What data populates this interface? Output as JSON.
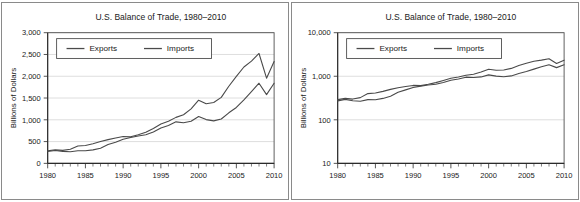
{
  "figure": {
    "panels": [
      "linear",
      "log"
    ]
  },
  "chart_data": [
    {
      "type": "line",
      "scale": "linear",
      "title": "U.S. Balance of Trade, 1980–2010",
      "xlabel": "",
      "ylabel": "Billions of Dollars",
      "xlim": [
        1980,
        2010
      ],
      "ylim": [
        0,
        3000
      ],
      "grid": true,
      "legend_position": "top-left",
      "ytick_labels": [
        "0",
        "500",
        "1,000",
        "1,500",
        "2,000",
        "2,500",
        "3,000"
      ],
      "ytick_values": [
        0,
        500,
        1000,
        1500,
        2000,
        2500,
        3000
      ],
      "xtick_labels": [
        "1980",
        "1985",
        "1990",
        "1995",
        "2000",
        "2005",
        "2010"
      ],
      "xtick_values": [
        1980,
        1985,
        1990,
        1995,
        2000,
        2005,
        2010
      ],
      "minor_xtick_interval": 1,
      "x": [
        1980,
        1981,
        1982,
        1983,
        1984,
        1985,
        1986,
        1987,
        1988,
        1989,
        1990,
        1991,
        1992,
        1993,
        1994,
        1995,
        1996,
        1997,
        1998,
        1999,
        2000,
        2001,
        2002,
        2003,
        2004,
        2005,
        2006,
        2007,
        2008,
        2009,
        2010
      ],
      "series": [
        {
          "name": "Exports",
          "values": [
            272,
            294,
            275,
            266,
            291,
            289,
            310,
            349,
            431,
            487,
            552,
            594,
            630,
            655,
            721,
            812,
            868,
            953,
            933,
            966,
            1075,
            1005,
            975,
            1018,
            1161,
            1283,
            1457,
            1646,
            1840,
            1578,
            1840
          ]
        },
        {
          "name": "Imports",
          "values": [
            291,
            310,
            299,
            323,
            400,
            411,
            449,
            500,
            545,
            581,
            616,
            609,
            656,
            713,
            801,
            903,
            965,
            1056,
            1115,
            1251,
            1450,
            1369,
            1397,
            1515,
            1770,
            1997,
            2212,
            2346,
            2523,
            1956,
            2338
          ]
        }
      ]
    },
    {
      "type": "line",
      "scale": "log",
      "title": "U.S. Balance of Trade, 1980–2010",
      "xlabel": "",
      "ylabel": "Billions of Dollars",
      "xlim": [
        1980,
        2010
      ],
      "ylim": [
        10,
        10000
      ],
      "grid": true,
      "legend_position": "top-left",
      "ytick_labels": [
        "10",
        "100",
        "1,000",
        "10,000"
      ],
      "ytick_values": [
        10,
        100,
        1000,
        10000
      ],
      "xtick_labels": [
        "1980",
        "1985",
        "1990",
        "1995",
        "2000",
        "2005",
        "2010"
      ],
      "xtick_values": [
        1980,
        1985,
        1990,
        1995,
        2000,
        2005,
        2010
      ],
      "minor_xtick_interval": 1,
      "x": [
        1980,
        1981,
        1982,
        1983,
        1984,
        1985,
        1986,
        1987,
        1988,
        1989,
        1990,
        1991,
        1992,
        1993,
        1994,
        1995,
        1996,
        1997,
        1998,
        1999,
        2000,
        2001,
        2002,
        2003,
        2004,
        2005,
        2006,
        2007,
        2008,
        2009,
        2010
      ],
      "series": [
        {
          "name": "Exports",
          "values": [
            272,
            294,
            275,
            266,
            291,
            289,
            310,
            349,
            431,
            487,
            552,
            594,
            630,
            655,
            721,
            812,
            868,
            953,
            933,
            966,
            1075,
            1005,
            975,
            1018,
            1161,
            1283,
            1457,
            1646,
            1840,
            1578,
            1840
          ]
        },
        {
          "name": "Imports",
          "values": [
            291,
            310,
            299,
            323,
            400,
            411,
            449,
            500,
            545,
            581,
            616,
            609,
            656,
            713,
            801,
            903,
            965,
            1056,
            1115,
            1251,
            1450,
            1369,
            1397,
            1515,
            1770,
            1997,
            2212,
            2346,
            2523,
            1956,
            2338
          ]
        }
      ]
    }
  ],
  "style": {
    "line_color": "#4a4a4a",
    "grid_color": "#c8c8c8",
    "axis_color": "#2b2b2b",
    "frame_color": "#8a8a8a",
    "text_color": "#1a1a1a",
    "background": "#ffffff"
  }
}
